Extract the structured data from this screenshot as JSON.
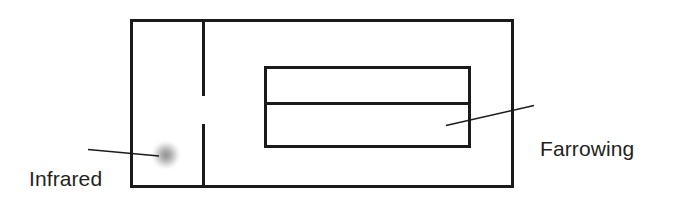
{
  "figure": {
    "kind": "line-diagram",
    "background_color": "#ffffff",
    "stroke_color": "#1a1a1a",
    "text_color": "#231f20",
    "lamp_glow_color": "#9a9a9a"
  },
  "labels": {
    "infrared_lamp": {
      "line1": "Infrared",
      "line2": "lamp"
    },
    "farrowing_crate": {
      "line1": "Farrowing",
      "line2": "crate"
    }
  },
  "shapes": {
    "pen_outline": {
      "x": 130,
      "y": 19,
      "width": 384,
      "height": 169
    },
    "pen_divider_upper": {
      "x": 203,
      "y1": 19,
      "y2": 96
    },
    "pen_divider_lower": {
      "x": 203,
      "y1": 124,
      "y2": 188
    },
    "crate_outline": {
      "x": 264,
      "y": 66,
      "width": 207,
      "height": 82
    },
    "crate_divider": {
      "x1": 264,
      "x2": 471,
      "y": 103
    },
    "lamp_glow": {
      "cx": 166,
      "cy": 155,
      "r": 15
    },
    "leader_lamp": {
      "x1": 88,
      "y1": 150,
      "x2": 158,
      "y2": 156
    },
    "leader_crate": {
      "x1": 447,
      "y1": 125,
      "x2": 533,
      "y2": 106
    }
  }
}
